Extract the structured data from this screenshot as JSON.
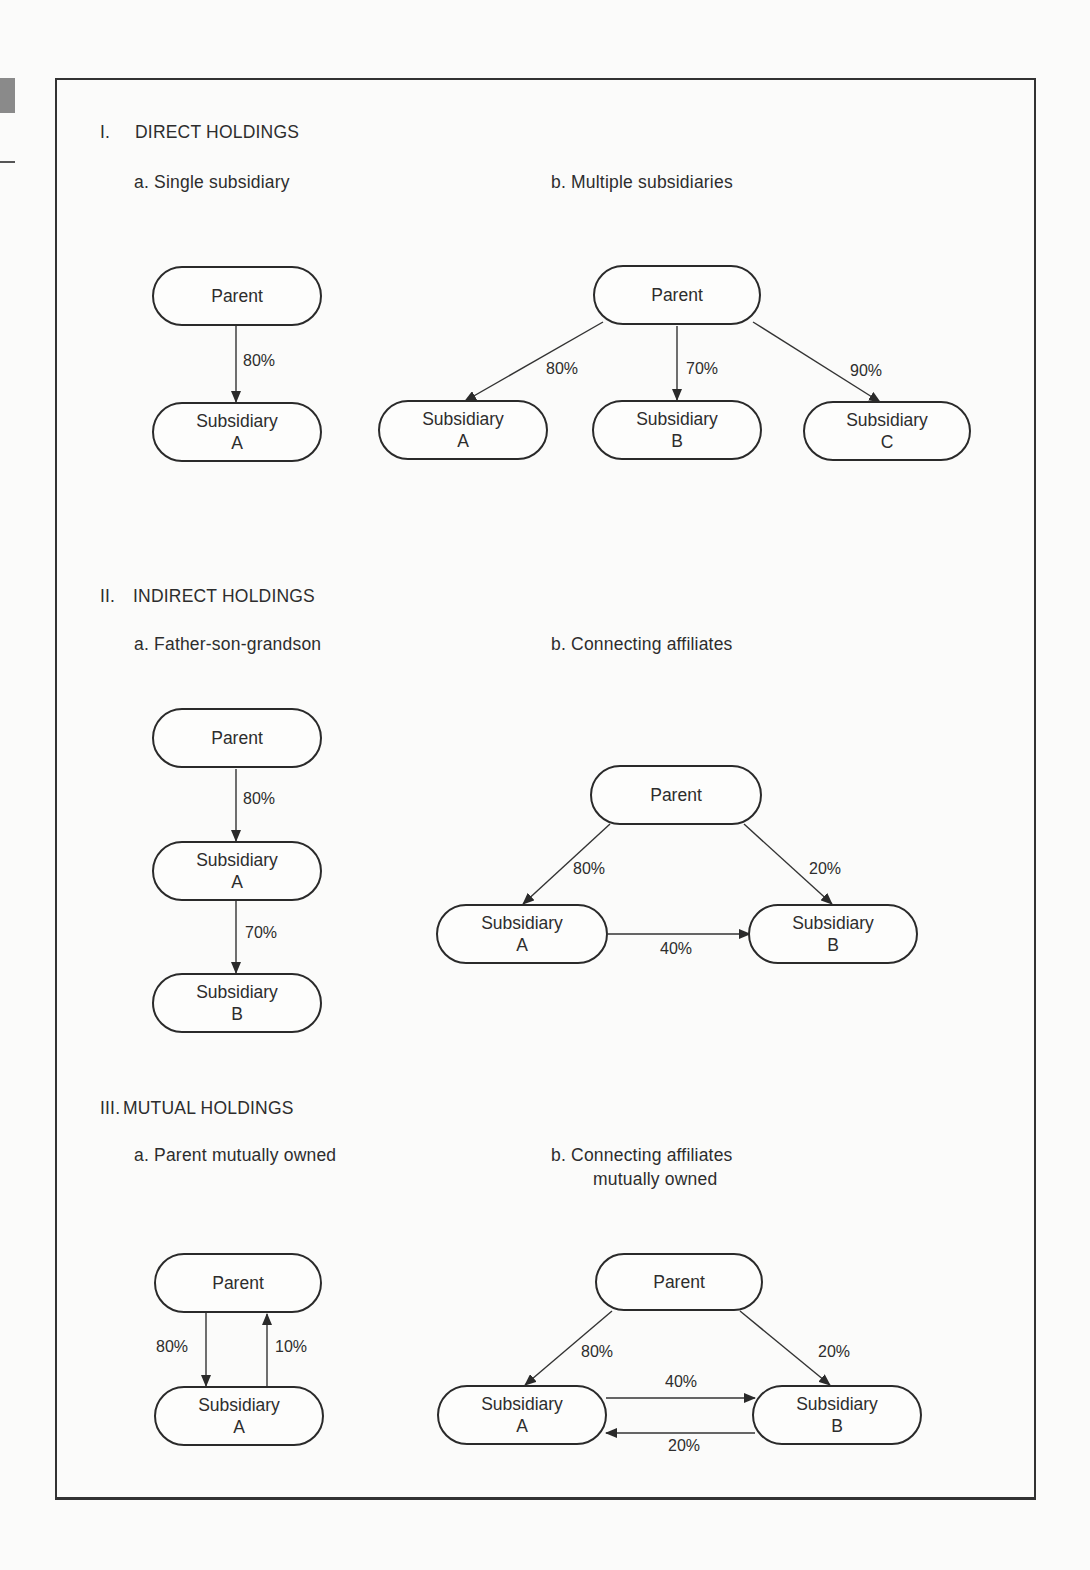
{
  "sections": [
    {
      "numeral": "I.",
      "title": "DIRECT HOLDINGS",
      "a": {
        "label": "a.  Single subsidiary",
        "nodes": {
          "parent": "Parent",
          "sub_a_line1": "Subsidiary",
          "sub_a_line2": "A"
        },
        "edges": {
          "parent_to_a": "80%"
        }
      },
      "b": {
        "label": "b.  Multiple subsidiaries",
        "nodes": {
          "parent": "Parent",
          "sub_a_line1": "Subsidiary",
          "sub_a_line2": "A",
          "sub_b_line1": "Subsidiary",
          "sub_b_line2": "B",
          "sub_c_line1": "Subsidiary",
          "sub_c_line2": "C"
        },
        "edges": {
          "parent_to_a": "80%",
          "parent_to_b": "70%",
          "parent_to_c": "90%"
        }
      }
    },
    {
      "numeral": "II.",
      "title": "INDIRECT HOLDINGS",
      "a": {
        "label": "a.  Father-son-grandson",
        "nodes": {
          "parent": "Parent",
          "sub_a_line1": "Subsidiary",
          "sub_a_line2": "A",
          "sub_b_line1": "Subsidiary",
          "sub_b_line2": "B"
        },
        "edges": {
          "parent_to_a": "80%",
          "a_to_b": "70%"
        }
      },
      "b": {
        "label": "b.  Connecting affiliates",
        "nodes": {
          "parent": "Parent",
          "sub_a_line1": "Subsidiary",
          "sub_a_line2": "A",
          "sub_b_line1": "Subsidiary",
          "sub_b_line2": "B"
        },
        "edges": {
          "parent_to_a": "80%",
          "parent_to_b": "20%",
          "a_to_b": "40%"
        }
      }
    },
    {
      "numeral": "III.",
      "title": "MUTUAL HOLDINGS",
      "a": {
        "label": "a.  Parent mutually owned",
        "nodes": {
          "parent": "Parent",
          "sub_a_line1": "Subsidiary",
          "sub_a_line2": "A"
        },
        "edges": {
          "parent_to_a": "80%",
          "a_to_parent": "10%"
        }
      },
      "b": {
        "label_line1": "b.  Connecting affiliates",
        "label_line2": "mutually owned",
        "nodes": {
          "parent": "Parent",
          "sub_a_line1": "Subsidiary",
          "sub_a_line2": "A",
          "sub_b_line1": "Subsidiary",
          "sub_b_line2": "B"
        },
        "edges": {
          "parent_to_a": "80%",
          "parent_to_b": "20%",
          "a_to_b": "40%",
          "b_to_a": "20%"
        }
      }
    }
  ]
}
